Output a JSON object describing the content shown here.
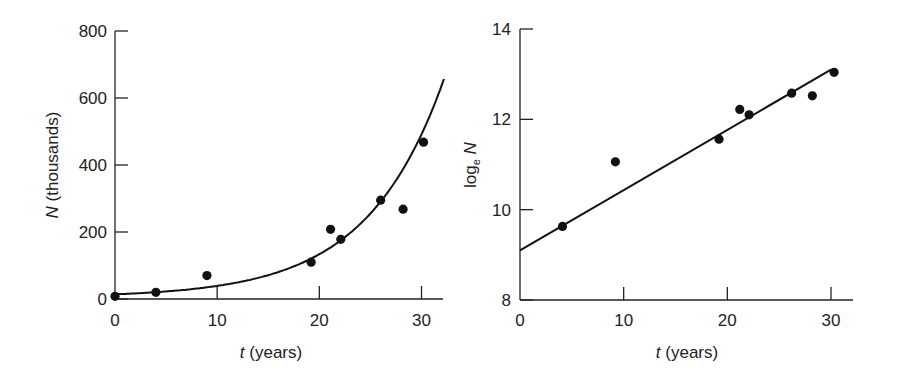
{
  "chart_data": [
    {
      "type": "scatter",
      "title": "",
      "xlabel_var": "t",
      "xlabel_unit": " (years)",
      "ylabel_var": "N",
      "ylabel_unit": " (thousands)",
      "xlim": [
        0,
        32
      ],
      "ylim": [
        0,
        800
      ],
      "xticks": [
        0,
        10,
        20,
        30
      ],
      "yticks": [
        0,
        200,
        400,
        600,
        800
      ],
      "grid": false,
      "series": [
        {
          "name": "observed",
          "type": "scatter",
          "x": [
            0,
            4,
            9,
            19.2,
            21.1,
            22.1,
            26,
            28.2,
            30.2
          ],
          "y": [
            8,
            20,
            70,
            110,
            208,
            178,
            295,
            268,
            468
          ]
        },
        {
          "name": "exponential fit",
          "type": "line",
          "equation": "N = 9 e^(0.133 t)",
          "N0": 9,
          "r": 0.133
        }
      ]
    },
    {
      "type": "scatter",
      "title": "",
      "xlabel_var": "t",
      "xlabel_unit": " (years)",
      "ylabel_prefix": "log",
      "ylabel_sub": "e",
      "ylabel_var": "N",
      "xlim": [
        0,
        32
      ],
      "ylim": [
        8,
        14
      ],
      "xticks": [
        0,
        10,
        20,
        30
      ],
      "yticks": [
        8,
        10,
        12,
        14
      ],
      "grid": false,
      "series": [
        {
          "name": "observed",
          "type": "scatter",
          "x": [
            4.1,
            9.2,
            19.2,
            21.2,
            22.1,
            26.2,
            28.2,
            30.3
          ],
          "y": [
            9.63,
            11.06,
            11.56,
            12.22,
            12.1,
            12.58,
            12.52,
            13.04
          ]
        },
        {
          "name": "linear fit",
          "type": "line",
          "x": [
            0,
            30
          ],
          "y": [
            9.1,
            13.1
          ]
        }
      ]
    }
  ]
}
